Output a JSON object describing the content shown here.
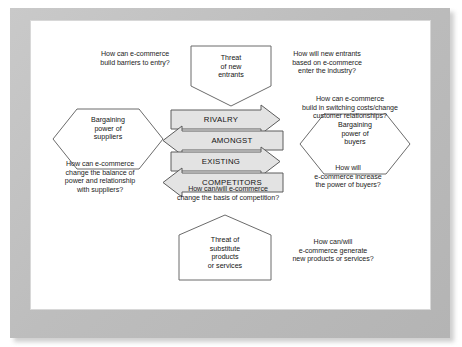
{
  "diagram": {
    "type": "porters-five-forces-ecommerce",
    "center": {
      "band_text": [
        "RIVALRY",
        "AMONGST",
        "EXISTING",
        "COMPETITORS"
      ],
      "band_directions": [
        "right",
        "left",
        "right",
        "left"
      ],
      "fill_color": "#e3e3e3",
      "stroke_color": "#5c5c5c"
    },
    "forces": [
      {
        "id": "new-entrants",
        "shape": "pentagon-down",
        "label": "Threat\nof new\nentrants",
        "position": "top"
      },
      {
        "id": "suppliers",
        "shape": "hexagon",
        "label": "Bargaining\npower of\nsuppliers",
        "position": "left"
      },
      {
        "id": "buyers",
        "shape": "hexagon",
        "label": "Bargaining\npower of\nbuyers",
        "position": "right"
      },
      {
        "id": "substitutes",
        "shape": "pentagon-up",
        "label": "Threat of\nsubstitute\nproducts\nor services",
        "position": "bottom"
      }
    ],
    "questions": [
      {
        "id": "entry-barriers",
        "text": "How can e-commerce\nbuild barriers to entry?",
        "relates_to": "new-entrants"
      },
      {
        "id": "new-entrants-industry",
        "text": "How will new entrants\nbased on  e-commerce\nenter the industry?",
        "relates_to": "new-entrants"
      },
      {
        "id": "switching-costs",
        "text": "How can e-commerce\nbuild in switching costs/change\ncustomer relationships?",
        "relates_to": "buyers"
      },
      {
        "id": "supplier-power",
        "text": "How can e-commerce\nchange the balance of\npower and relationship\nwith suppliers?",
        "relates_to": "suppliers"
      },
      {
        "id": "buyer-power",
        "text": "How will\ne-commerce increase\nthe power of buyers?",
        "relates_to": "buyers"
      },
      {
        "id": "basis-of-competition",
        "text": "How can/will e-commerce\nchange the basis of competition?",
        "relates_to": "rivalry"
      },
      {
        "id": "new-products",
        "text": "How can/will\ne-commerce generate\nnew products or services?",
        "relates_to": "substitutes"
      }
    ]
  },
  "colors": {
    "page_background": "#ffffff",
    "frame": "#c2c2c2",
    "shape_stroke": "#6b6b6b",
    "band_fill": "#e3e3e3",
    "text": "#1d1d1d"
  }
}
